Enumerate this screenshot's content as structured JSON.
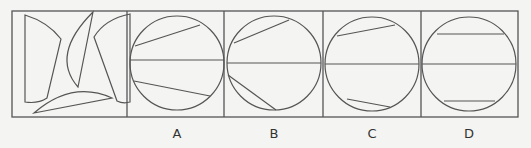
{
  "figure": {
    "stroke_color": "#555555",
    "background": "#f4f4f2",
    "frame": {
      "x": 12,
      "y": 11,
      "w": 506,
      "h": 106
    },
    "dividers_x": [
      127,
      224,
      323,
      421
    ],
    "question_panel": {
      "description": "Four cut-out pieces to be assembled into a circle",
      "pieces": [
        {
          "name": "left-piece",
          "d": "M25,15 L25,102 Q38,104 47,98 L61,39 Q48,22 25,15 Z"
        },
        {
          "name": "crescent-piece",
          "d": "M93,12 L78,87 Q50,55 93,12 Z"
        },
        {
          "name": "right-piece",
          "d": "M130,14 Q105,19 94,37 L117,101 Q123,104 130,102 Z"
        },
        {
          "name": "bottom-segment-piece",
          "d": "M34,113 L112,98 Q72,80 34,113 Z"
        }
      ]
    },
    "options": [
      {
        "label": "A",
        "cx": 177,
        "cy": 63,
        "r": 47,
        "label_x": 167,
        "chords": [
          [
            130,
            60,
            224,
            60
          ],
          [
            135,
            46,
            200,
            25
          ],
          [
            134,
            81,
            210,
            96
          ]
        ]
      },
      {
        "label": "B",
        "cx": 274,
        "cy": 63,
        "r": 47,
        "label_x": 264,
        "chords": [
          [
            227,
            63,
            321,
            63
          ],
          [
            234,
            43,
            289,
            20
          ],
          [
            228,
            75,
            276,
            110
          ]
        ]
      },
      {
        "label": "C",
        "cx": 372,
        "cy": 64,
        "r": 47,
        "label_x": 362,
        "chords": [
          [
            325,
            64,
            419,
            64
          ],
          [
            337,
            36,
            395,
            25
          ],
          [
            347,
            99,
            390,
            107
          ]
        ]
      },
      {
        "label": "D",
        "cx": 469,
        "cy": 64,
        "r": 47,
        "label_x": 459,
        "chords": [
          [
            422,
            64,
            516,
            64
          ],
          [
            437,
            34,
            504,
            34
          ],
          [
            444,
            101,
            495,
            101
          ]
        ]
      }
    ]
  }
}
